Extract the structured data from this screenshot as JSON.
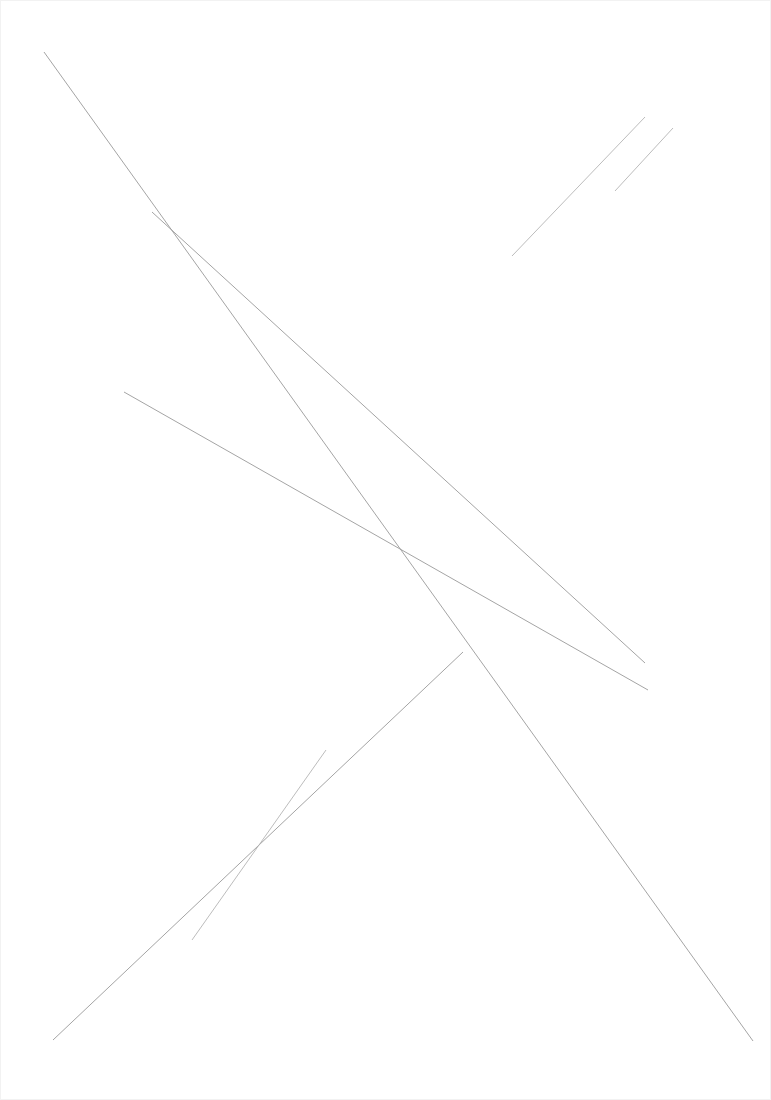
{
  "page": {
    "width": 771,
    "height": 1100,
    "background_color": "#ffffff",
    "border_color": "#f2f2f2",
    "visible_text": ""
  },
  "ink": {
    "default_stroke_color": "#9a9a9a",
    "light_stroke_color": "#b4b4b4",
    "default_stroke_width": 0.9
  },
  "chart_data": {
    "type": "line",
    "title": "",
    "xlabel": "",
    "ylabel": "",
    "xlim": [
      0,
      771
    ],
    "ylim": [
      0,
      1100
    ],
    "grid": false,
    "legend": "none",
    "y_axis_inverted": true,
    "annotations": [],
    "tick_labels": {
      "x": [],
      "y": []
    },
    "series": [
      {
        "name": "major-diagonal-1",
        "orientation": "top-left-to-bottom-right",
        "color": "#9a9a9a",
        "width": 0.9,
        "x": [
          44,
          753
        ],
        "y": [
          52,
          1041
        ]
      },
      {
        "name": "major-diagonal-2",
        "orientation": "top-left-to-bottom-right",
        "color": "#9a9a9a",
        "width": 0.9,
        "x": [
          152,
          645
        ],
        "y": [
          212,
          663
        ]
      },
      {
        "name": "major-diagonal-3",
        "orientation": "top-left-to-bottom-right",
        "color": "#9a9a9a",
        "width": 0.9,
        "x": [
          124,
          648
        ],
        "y": [
          392,
          690
        ]
      },
      {
        "name": "anti-diagonal-upper-right-long",
        "orientation": "bottom-left-to-top-right",
        "color": "#b4b4b4",
        "width": 0.9,
        "x": [
          512,
          645
        ],
        "y": [
          256,
          117
        ]
      },
      {
        "name": "anti-diagonal-upper-right-short",
        "orientation": "bottom-left-to-top-right",
        "color": "#b4b4b4",
        "width": 0.9,
        "x": [
          615,
          673
        ],
        "y": [
          191,
          128
        ]
      },
      {
        "name": "anti-diagonal-crossing-long",
        "orientation": "bottom-left-to-top-right",
        "color": "#9a9a9a",
        "width": 0.9,
        "x": [
          53,
          463
        ],
        "y": [
          1040,
          652
        ]
      },
      {
        "name": "anti-diagonal-lower-left-short",
        "orientation": "bottom-left-to-top-right",
        "color": "#b4b4b4",
        "width": 0.9,
        "x": [
          192,
          326
        ],
        "y": [
          940,
          750
        ]
      }
    ],
    "intersections": [
      {
        "name": "x-crossing",
        "x": 425,
        "y": 702
      }
    ]
  }
}
